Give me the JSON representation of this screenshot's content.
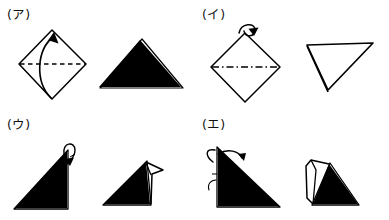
{
  "document": {
    "title": "Origami folding step diagrams",
    "background_color": "#ffffff",
    "ink_color": "#000000",
    "panel_count": 4
  },
  "panels": [
    {
      "id": "panel-a",
      "label": "(ア)",
      "position": "top-left",
      "before": {
        "shape_name": "diamond-square",
        "description": "Square rotated 45 degrees with a dashed horizontal diagonal crease line",
        "fill": "none",
        "crease": "dashed-horizontal-diagonal"
      },
      "arrow": {
        "icon": "curved-fold-arrow",
        "direction": "bottom-vertex-to-top-vertex",
        "style": "solid-curved-with-arrowhead"
      },
      "after": {
        "shape_name": "filled-triangle-up",
        "description": "Solid black triangle pointing up",
        "fill": "solid-black",
        "orientation": "apex-up"
      }
    },
    {
      "id": "panel-b",
      "label": "(イ)",
      "position": "top-right",
      "before": {
        "shape_name": "diamond-square",
        "description": "Square rotated 45 degrees with a dash-dot horizontal diagonal crease line",
        "fill": "none",
        "crease": "dash-dot-horizontal-diagonal"
      },
      "arrow": {
        "icon": "looped-fold-arrow",
        "direction": "curl-at-top-vertex",
        "style": "small-loop-with-arrowhead"
      },
      "after": {
        "shape_name": "outlined-triangle-down",
        "description": "Outlined triangle pointing down, unfilled interior",
        "fill": "none",
        "orientation": "apex-down"
      }
    },
    {
      "id": "panel-c",
      "label": "(ウ)",
      "position": "bottom-left",
      "before": {
        "shape_name": "filled-right-triangle",
        "description": "Solid black right triangle, apex upper right, with a loop arrow at the apex",
        "fill": "solid-black",
        "orientation": "apex-upper-right"
      },
      "arrow": {
        "icon": "loop-fold-arrow",
        "direction": "apex-folds-down-right",
        "style": "loop-with-small-arrowhead"
      },
      "after": {
        "shape_name": "filled-triangle-with-flap-right",
        "description": "Solid black triangle with an outlined flap folded over at the right peak",
        "fill": "solid-black-with-outlined-flap",
        "flap_side": "right"
      }
    },
    {
      "id": "panel-d",
      "label": "(エ)",
      "position": "bottom-right",
      "before": {
        "shape_name": "filled-right-triangle",
        "description": "Solid black right triangle, apex upper left, with fold arrows on the left edge",
        "fill": "solid-black",
        "orientation": "apex-upper-left"
      },
      "arrow": {
        "icon": "fold-arrow-pair",
        "direction": "left-edge-folds-right",
        "style": "curved-arrow-with-arrowhead"
      },
      "after": {
        "shape_name": "filled-triangle-with-flap-left",
        "description": "Solid black triangle with an outlined flap folded up on the left side",
        "fill": "solid-black-with-outlined-flap",
        "flap_side": "left"
      }
    }
  ]
}
